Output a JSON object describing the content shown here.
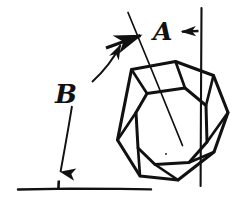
{
  "figure": {
    "kind": "hand-drawn-crystal-diagram",
    "title": "",
    "background_color": "#ffffff",
    "ink_color": "#111111",
    "width": 248,
    "height": 206
  },
  "labels": {
    "angle_a": "A",
    "angle_b": "B"
  },
  "annotations": {
    "vertical_reference_line": "vertical-reference-line",
    "horizontal_baseline": "horizontal-baseline",
    "crystal_axis_line": "crystal-axis-line",
    "a_arrow_left": "arrow-pointing-left-from-vertical-line",
    "a_arrow_to_axis": "arrow-pointing-to-crystal-axis",
    "b_leader_curve": "curved-leader-to-axis-arrow",
    "b_arrow_down": "curved-arrow-pointing-down-to-baseline",
    "baseline_tick": "baseline-tick-mark"
  },
  "crystal": {
    "name": "truncated-octahedron",
    "outer_octagon": [
      [
        131,
        69
      ],
      [
        175,
        62
      ],
      [
        213,
        75
      ],
      [
        228,
        112
      ],
      [
        214,
        152
      ],
      [
        178,
        180
      ],
      [
        140,
        176
      ],
      [
        118,
        140
      ]
    ],
    "inner_octagon": [
      [
        147,
        93
      ],
      [
        185,
        88
      ],
      [
        206,
        105
      ],
      [
        207,
        142
      ],
      [
        189,
        162
      ],
      [
        155,
        164
      ],
      [
        138,
        148
      ],
      [
        136,
        112
      ]
    ],
    "face_count": 8
  }
}
